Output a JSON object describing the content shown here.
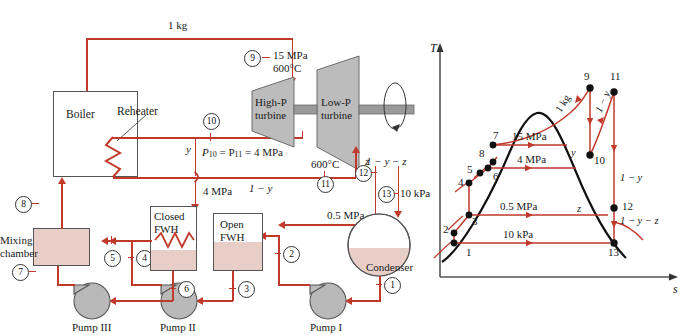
{
  "figure": {
    "left_title": "Regenerative-reheat Rankine cycle schematic",
    "right_title": "T-s diagram"
  },
  "schematic": {
    "components": {
      "boiler": "Boiler",
      "reheater": "Reheater",
      "high_p_turbine_l1": "High-P",
      "high_p_turbine_l2": "turbine",
      "low_p_turbine_l1": "Low-P",
      "low_p_turbine_l2": "turbine",
      "closed_fwh_l1": "Closed",
      "closed_fwh_l2": "FWH",
      "open_fwh_l1": "Open",
      "open_fwh_l2": "FWH",
      "condenser": "Condenser",
      "mixing_chamber_l1": "Mixing",
      "mixing_chamber_l2": "chamber",
      "pump_i": "Pump I",
      "pump_ii": "Pump II",
      "pump_iii": "Pump III"
    },
    "annotations": {
      "mass_1kg": "1 kg",
      "p9_pressure": "15 MPa",
      "p9_temp": "600°C",
      "reheat_pressure_eq": "P10 = P11 = 4 MPa",
      "reheat_pressure_eq_p": "P",
      "reheat_pressure_eq_s1": "10",
      "reheat_pressure_eq_mid": " = P",
      "reheat_pressure_eq_s2": "11",
      "reheat_pressure_eq_tail": " = 4 MPa",
      "y_fraction": "y",
      "one_minus_y": "1 − y",
      "one_minus_y_minus_z": "1 − y − z",
      "z_fraction": "z",
      "four_mpa": "4 MPa",
      "reheat_temp": "600°C",
      "half_mpa": "0.5 MPa",
      "ten_kpa": "10 kPa"
    },
    "states": [
      "1",
      "2",
      "3",
      "4",
      "5",
      "6",
      "7",
      "8",
      "9",
      "10",
      "11",
      "12",
      "13"
    ]
  },
  "ts_diagram": {
    "axes": {
      "y_label": "T",
      "x_label": "s"
    },
    "isobars": [
      {
        "label": "15 MPa",
        "value_mpa": 15
      },
      {
        "label": "4 MPa",
        "value_mpa": 4
      },
      {
        "label": "0.5 MPa",
        "value_mpa": 0.5
      },
      {
        "label": "10 kPa",
        "value_mpa": 0.01
      }
    ],
    "state_labels": [
      "1",
      "2",
      "3",
      "4",
      "5",
      "6",
      "7",
      "8",
      "9",
      "10",
      "11",
      "12",
      "13"
    ],
    "flow_labels": {
      "one_kg": "1 kg",
      "one_minus_y_upper": "1 − y",
      "one_minus_y_right": "1 − y",
      "one_minus_y_minus_z": "1 − y − z",
      "y": "y",
      "z": "z"
    }
  },
  "colors": {
    "pipe": "#c0392b",
    "pink_fill": "#e7cfc8",
    "gray_fill": "#bcbcbc",
    "outline": "#555555",
    "dome": "#111111"
  }
}
